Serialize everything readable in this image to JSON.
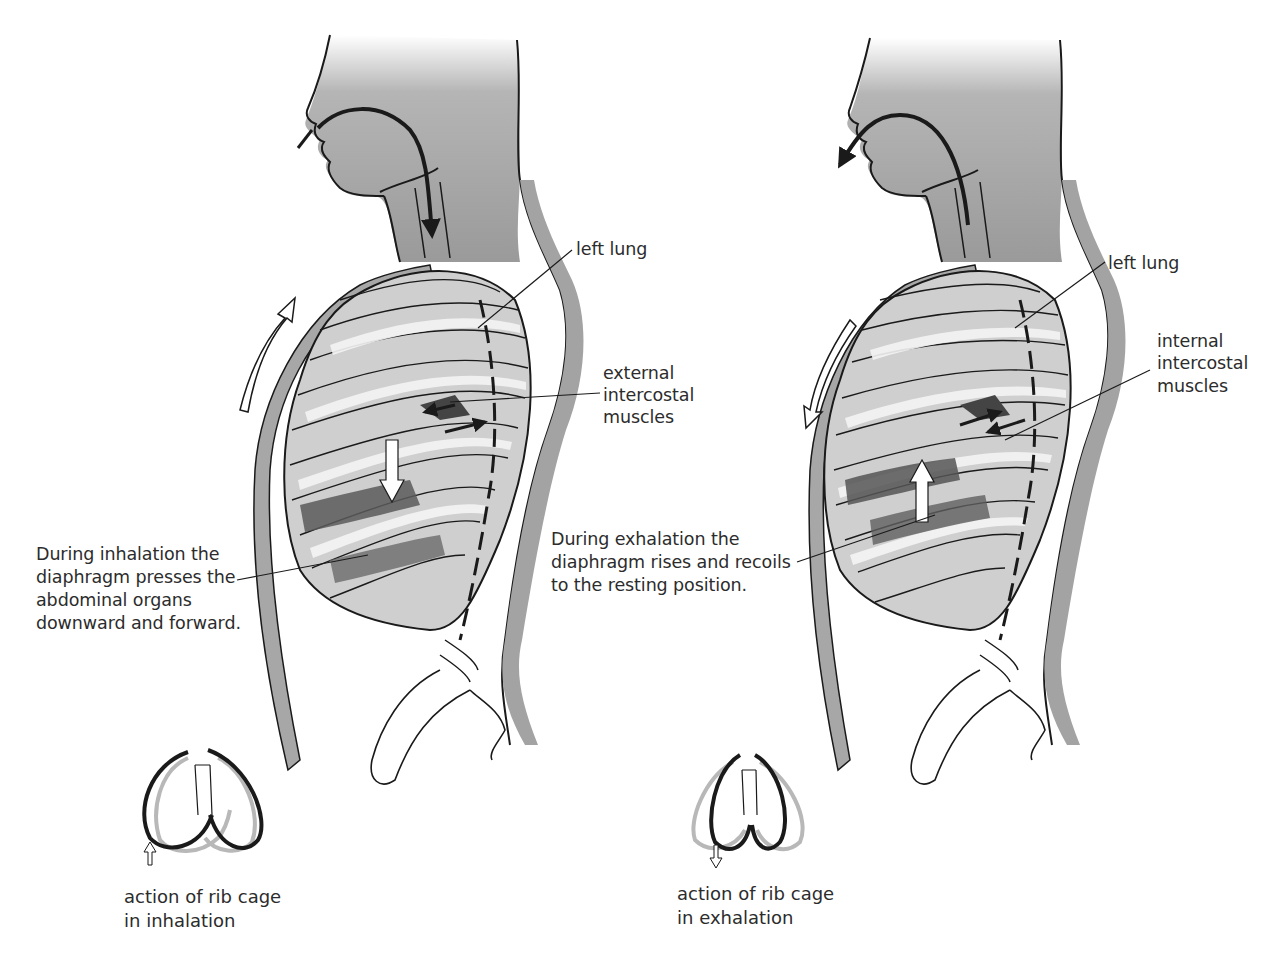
{
  "diagram": {
    "panels": [
      {
        "id": "inhalation",
        "labels": {
          "lung": "left lung",
          "muscles_line1": "external",
          "muscles_line2": "intercostal",
          "muscles_line3": "muscles",
          "diaphragm_line1": "During inhalation the",
          "diaphragm_line2": "diaphragm presses the",
          "diaphragm_line3": "abdominal organs",
          "diaphragm_line4": "downward and forward."
        },
        "ribcage_caption_line1": "action of rib cage",
        "ribcage_caption_line2": "in inhalation",
        "airflow_direction": "in",
        "chest_arrow_direction": "up"
      },
      {
        "id": "exhalation",
        "labels": {
          "lung": "left lung",
          "muscles_line1": "internal",
          "muscles_line2": "intercostal",
          "muscles_line3": "muscles",
          "diaphragm_line1": "During exhalation the",
          "diaphragm_line2": "diaphragm rises and recoils",
          "diaphragm_line3": "to the resting position."
        },
        "ribcage_caption_line1": "action of rib cage",
        "ribcage_caption_line2": "in exhalation",
        "airflow_direction": "out",
        "chest_arrow_direction": "down"
      }
    ],
    "colors": {
      "ink": "#1a1a1a",
      "body_gray": "#9a9a9a",
      "rib_gray": "#bdbdbd",
      "muscle_dark": "#555555",
      "ghost_gray": "#b8b8b8"
    }
  }
}
